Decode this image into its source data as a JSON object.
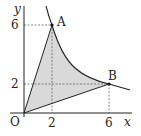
{
  "diagram": {
    "axes": {
      "x_label": "x",
      "y_label": "y",
      "origin_label": "O"
    },
    "ticks": {
      "x": [
        "2",
        "6"
      ],
      "y": [
        "6",
        "2"
      ]
    },
    "points": [
      {
        "name": "A",
        "x": 2,
        "y": 6
      },
      {
        "name": "B",
        "x": 6,
        "y": 2
      }
    ],
    "curve": "y = 12/x",
    "shaded_region": "triangle O-A-B bounded by curve AB",
    "colors": {
      "shade": "#d9d9d9",
      "line": "#222222"
    }
  }
}
